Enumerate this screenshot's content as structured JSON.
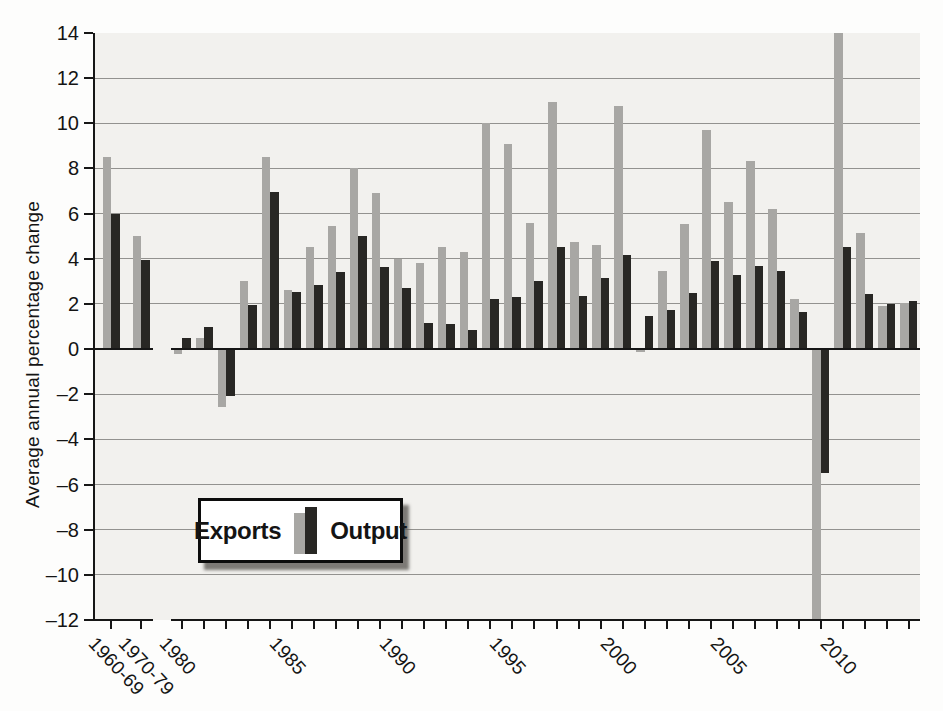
{
  "page": {
    "background": "#fdfdfc"
  },
  "colors": {
    "exports_bar": "#a8a7a4",
    "output_bar": "#282724",
    "plot_background": "#f2f1ee",
    "gridline": "#93928f",
    "axis": "#161616",
    "text": "#141414",
    "legend_border": "#0c0c0c",
    "legend_background": "#ffffff"
  },
  "legend": {
    "exports_label": "Exports",
    "output_label": "Output"
  },
  "chart_data": {
    "type": "bar",
    "title": "",
    "xlabel": "",
    "ylabel": "Average annual percentage change",
    "ylim": [
      -12,
      14
    ],
    "yticks": [
      14,
      12,
      10,
      8,
      6,
      4,
      2,
      0,
      -2,
      -4,
      -6,
      -8,
      -10,
      -12
    ],
    "grid": true,
    "legend_position": "inside-lower-left",
    "legend_entries": [
      "Exports",
      "Output"
    ],
    "group_break_after_index": 1,
    "xtick_labeled": [
      "1960-69",
      "1970-79",
      "1980",
      "1985",
      "1990",
      "1995",
      "2000",
      "2005",
      "2010"
    ],
    "categories": [
      "1960-69",
      "1970-79",
      "1980",
      "1981",
      "1982",
      "1983",
      "1984",
      "1985",
      "1986",
      "1987",
      "1988",
      "1989",
      "1990",
      "1991",
      "1992",
      "1993",
      "1994",
      "1995",
      "1996",
      "1997",
      "1998",
      "1999",
      "2000",
      "2001",
      "2002",
      "2003",
      "2004",
      "2005",
      "2006",
      "2007",
      "2008",
      "2009",
      "2010",
      "2011",
      "2012",
      "2013"
    ],
    "series": [
      {
        "name": "Exports",
        "values": [
          8.5,
          5.0,
          -0.2,
          0.5,
          -2.55,
          3.0,
          8.5,
          2.6,
          4.5,
          5.45,
          8.0,
          6.9,
          4.0,
          3.8,
          4.5,
          4.3,
          10.0,
          9.1,
          5.6,
          10.95,
          4.75,
          4.6,
          10.75,
          -0.15,
          3.45,
          5.55,
          9.7,
          6.5,
          8.35,
          6.2,
          2.2,
          -12.0,
          14.0,
          5.15,
          1.9,
          2.05
        ]
      },
      {
        "name": "Output",
        "values": [
          6.0,
          3.95,
          0.5,
          1.0,
          -2.1,
          1.95,
          6.95,
          2.55,
          2.85,
          3.4,
          5.0,
          3.65,
          2.7,
          1.15,
          1.1,
          0.85,
          2.2,
          2.3,
          3.0,
          4.5,
          2.35,
          3.15,
          4.15,
          1.45,
          1.75,
          2.5,
          3.9,
          3.3,
          3.7,
          3.45,
          1.65,
          -5.5,
          4.5,
          2.45,
          2.0,
          2.15
        ]
      }
    ]
  }
}
